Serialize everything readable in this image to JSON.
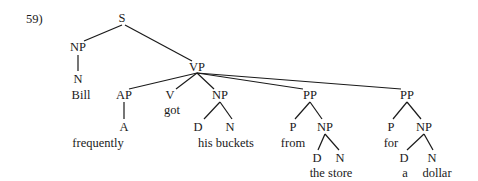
{
  "example_number": "59)",
  "tree": {
    "nodes": [
      {
        "id": "S",
        "label": "S",
        "x": 122,
        "y": 11
      },
      {
        "id": "NP1",
        "label": "NP",
        "x": 78,
        "y": 40
      },
      {
        "id": "N1",
        "label": "N",
        "x": 78,
        "y": 72
      },
      {
        "id": "W1",
        "label": "Bill",
        "x": 81,
        "y": 88
      },
      {
        "id": "VP",
        "label": "VP",
        "x": 197,
        "y": 60
      },
      {
        "id": "AP",
        "label": "AP",
        "x": 124,
        "y": 88
      },
      {
        "id": "A",
        "label": "A",
        "x": 124,
        "y": 120
      },
      {
        "id": "W2",
        "label": "frequently",
        "x": 98,
        "y": 136
      },
      {
        "id": "V",
        "label": "V",
        "x": 170,
        "y": 88
      },
      {
        "id": "W3",
        "label": "got",
        "x": 172,
        "y": 103
      },
      {
        "id": "NP2",
        "label": "NP",
        "x": 220,
        "y": 88
      },
      {
        "id": "D2",
        "label": "D",
        "x": 198,
        "y": 120
      },
      {
        "id": "N2",
        "label": "N",
        "x": 230,
        "y": 120
      },
      {
        "id": "W4",
        "label": "his buckets",
        "x": 226,
        "y": 136
      },
      {
        "id": "PP1",
        "label": "PP",
        "x": 310,
        "y": 88
      },
      {
        "id": "P1",
        "label": "P",
        "x": 293,
        "y": 120
      },
      {
        "id": "W5",
        "label": "from",
        "x": 293,
        "y": 136
      },
      {
        "id": "NP3",
        "label": "NP",
        "x": 325,
        "y": 120
      },
      {
        "id": "D3",
        "label": "D",
        "x": 317,
        "y": 151
      },
      {
        "id": "N3",
        "label": "N",
        "x": 340,
        "y": 151
      },
      {
        "id": "W6",
        "label": "the store",
        "x": 331,
        "y": 166
      },
      {
        "id": "PP2",
        "label": "PP",
        "x": 407,
        "y": 88
      },
      {
        "id": "P2",
        "label": "P",
        "x": 391,
        "y": 120
      },
      {
        "id": "W7",
        "label": "for",
        "x": 391,
        "y": 136
      },
      {
        "id": "NP4",
        "label": "NP",
        "x": 424,
        "y": 120
      },
      {
        "id": "D4",
        "label": "D",
        "x": 404,
        "y": 151
      },
      {
        "id": "N4",
        "label": "N",
        "x": 432,
        "y": 151
      },
      {
        "id": "W8",
        "label": "a",
        "x": 405,
        "y": 166
      },
      {
        "id": "W9",
        "label": "dollar",
        "x": 437,
        "y": 166
      }
    ],
    "edges": [
      [
        122,
        25,
        84,
        41
      ],
      [
        125,
        25,
        192,
        61
      ],
      [
        78,
        55,
        78,
        71
      ],
      [
        197,
        73,
        129,
        89
      ],
      [
        197,
        73,
        176,
        89
      ],
      [
        197,
        73,
        214,
        89
      ],
      [
        197,
        73,
        303,
        89
      ],
      [
        197,
        73,
        401,
        89
      ],
      [
        124,
        102,
        124,
        119
      ],
      [
        220,
        102,
        204,
        119
      ],
      [
        220,
        102,
        232,
        119
      ],
      [
        310,
        102,
        295,
        119
      ],
      [
        310,
        102,
        322,
        119
      ],
      [
        325,
        134,
        318,
        150
      ],
      [
        325,
        134,
        339,
        150
      ],
      [
        407,
        102,
        393,
        119
      ],
      [
        407,
        102,
        421,
        119
      ],
      [
        424,
        134,
        407,
        150
      ],
      [
        424,
        134,
        433,
        150
      ]
    ]
  }
}
